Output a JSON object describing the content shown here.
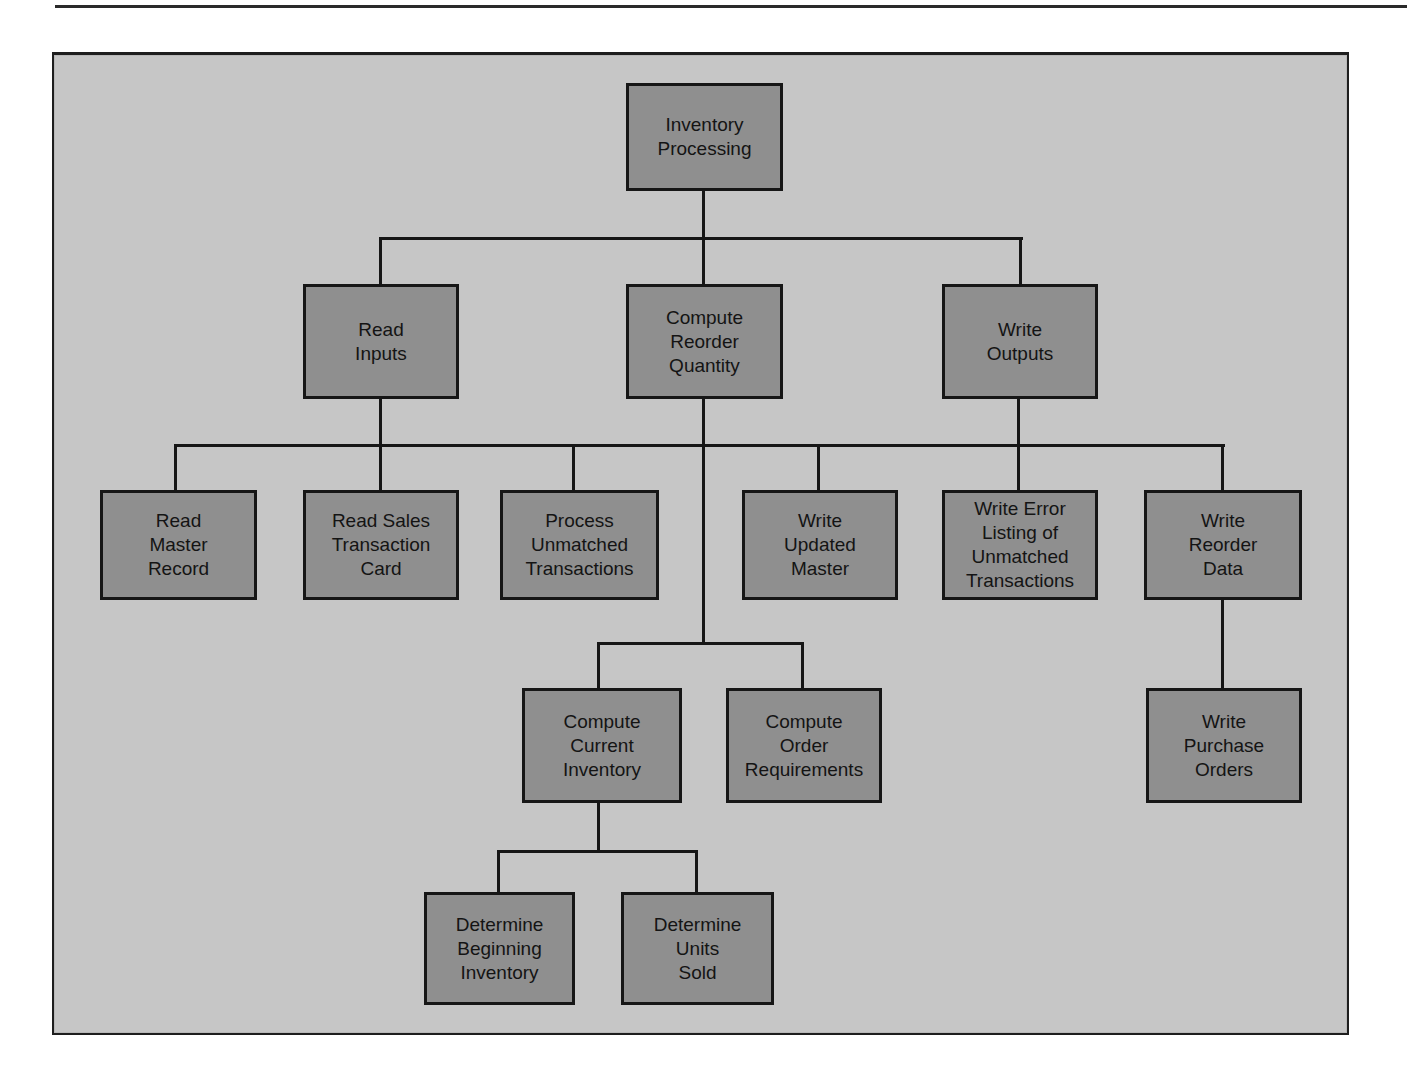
{
  "diagram": {
    "type": "hierarchy-chart",
    "colors": {
      "background": "#c6c6c6",
      "node_fill": "#8f8f8f",
      "node_border": "#161616",
      "text": "#141414"
    },
    "root": {
      "id": "inventory-processing",
      "label": "Inventory\nProcessing"
    },
    "level1": [
      {
        "id": "read-inputs",
        "label": "Read\nInputs"
      },
      {
        "id": "compute-reorder-quantity",
        "label": "Compute\nReorder\nQuantity"
      },
      {
        "id": "write-outputs",
        "label": "Write\nOutputs"
      }
    ],
    "level2": [
      {
        "id": "read-master-record",
        "label": "Read\nMaster\nRecord",
        "parent": "read-inputs"
      },
      {
        "id": "read-sales-transaction-card",
        "label": "Read Sales\nTransaction\nCard",
        "parent": "read-inputs"
      },
      {
        "id": "process-unmatched-transactions",
        "label": "Process\nUnmatched\nTransactions",
        "parent": "read-inputs"
      },
      {
        "id": "write-updated-master",
        "label": "Write\nUpdated\nMaster",
        "parent": "write-outputs"
      },
      {
        "id": "write-error-listing",
        "label": "Write Error\nListing of\nUnmatched\nTransactions",
        "parent": "write-outputs"
      },
      {
        "id": "write-reorder-data",
        "label": "Write\nReorder\nData",
        "parent": "write-outputs"
      }
    ],
    "level3": [
      {
        "id": "compute-current-inventory",
        "label": "Compute\nCurrent\nInventory",
        "parent": "compute-reorder-quantity"
      },
      {
        "id": "compute-order-requirements",
        "label": "Compute\nOrder\nRequirements",
        "parent": "compute-reorder-quantity"
      },
      {
        "id": "write-purchase-orders",
        "label": "Write\nPurchase\nOrders",
        "parent": "write-reorder-data"
      }
    ],
    "level4": [
      {
        "id": "determine-beginning-inventory",
        "label": "Determine\nBeginning\nInventory",
        "parent": "compute-current-inventory"
      },
      {
        "id": "determine-units-sold",
        "label": "Determine\nUnits\nSold",
        "parent": "compute-current-inventory"
      }
    ]
  }
}
